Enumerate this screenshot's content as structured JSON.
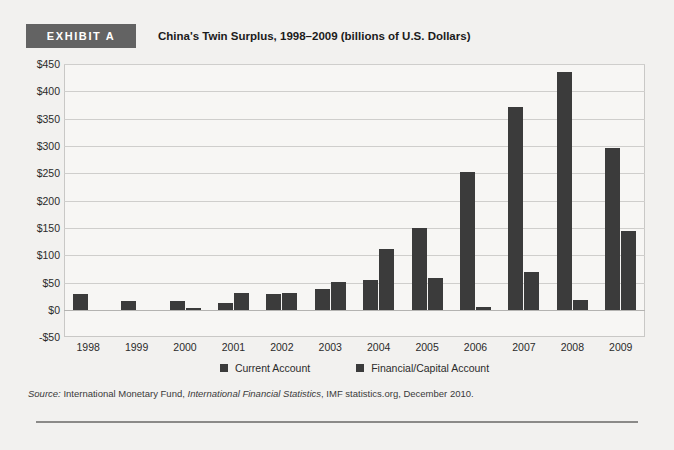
{
  "exhibit": {
    "badge_label": "EXHIBIT A",
    "title": "China's Twin Surplus, 1998–2009 (billions of U.S. Dollars)"
  },
  "source": {
    "prefix": "Source:",
    "text_1": " International Monetary Fund, ",
    "italic_1": "International Financial Statistics",
    "text_2": ", IMF statistics.org, December 2010."
  },
  "legend": {
    "items": [
      {
        "label": "Current Account",
        "color": "#3b3b3b"
      },
      {
        "label": "Financial/Capital Account",
        "color": "#3b3b3b"
      }
    ]
  },
  "axis": {
    "y_ticks": [
      "$450",
      "$400",
      "$350",
      "$300",
      "$250",
      "$200",
      "$150",
      "$100",
      "$50",
      "$0",
      "-$50"
    ],
    "x_ticks": [
      "1998",
      "1999",
      "2000",
      "2001",
      "2002",
      "2003",
      "2004",
      "2005",
      "2006",
      "2007",
      "2008",
      "2009"
    ]
  },
  "colors": {
    "bar": "#3b3b3b",
    "badge": "#636363",
    "page_background": "#f2f1ef",
    "plot_background": "#f7f6f4",
    "gridline": "#cfcecc",
    "rule": "#8b8a88"
  },
  "chart_data": {
    "type": "bar",
    "title": "China's Twin Surplus, 1998–2009 (billions of U.S. Dollars)",
    "xlabel": "",
    "ylabel": "billions of U.S. Dollars",
    "ylim": [
      -50,
      450
    ],
    "ytick_step": 50,
    "grid": true,
    "legend_position": "bottom",
    "categories": [
      "1998",
      "1999",
      "2000",
      "2001",
      "2002",
      "2003",
      "2004",
      "2005",
      "2006",
      "2007",
      "2008",
      "2009"
    ],
    "series": [
      {
        "name": "Current Account",
        "color": "#3b3b3b",
        "values": [
          29,
          16,
          17,
          13,
          30,
          38,
          55,
          150,
          253,
          372,
          436,
          297
        ]
      },
      {
        "name": "Financial/Capital Account",
        "color": "#3b3b3b",
        "values": [
          0,
          0,
          2,
          32,
          32,
          52,
          111,
          58,
          5,
          70,
          18,
          145
        ]
      }
    ]
  }
}
